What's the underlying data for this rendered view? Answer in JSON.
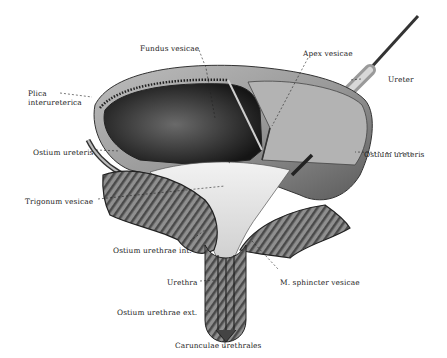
{
  "figure": {
    "labels": {
      "fundus": "Fundus vesicae",
      "apex": "Apex vesicae",
      "ureter": "Ureter",
      "plica_line1": "Plica",
      "plica_line2": "interureterica",
      "ostium_ureteris_left": "Ostium ureteris",
      "ostium_ureteris_right": "Ostium ureteris",
      "trigonum": "Trigonum vesicae",
      "ostium_urethrae_int": "Ostium urethrae int.",
      "urethra": "Urethra",
      "sphincter": "M. sphincter vesicae",
      "ostium_urethrae_ext": "Ostium urethrae ext.",
      "carunculae": "Carunculae urethrales"
    },
    "colors": {
      "ink": "#222222",
      "wall_light": "#c9c9c9",
      "wall_mid": "#8a8a8a",
      "wall_dark": "#3a3a3a",
      "interior_dark": "#1e1e1e",
      "trigone": "#e6e6e6"
    }
  }
}
